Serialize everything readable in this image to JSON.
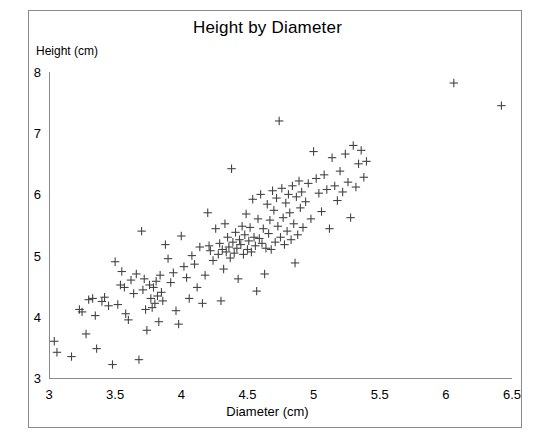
{
  "chart_data": {
    "type": "scatter",
    "title": "Height by Diameter",
    "xlabel": "Diameter (cm)",
    "ylabel": "Height (cm)",
    "xlim": [
      3,
      6.5
    ],
    "ylim": [
      3,
      8
    ],
    "xticks": [
      "3",
      "3.5",
      "4",
      "4.5",
      "5",
      "5.5",
      "6",
      "6.5"
    ],
    "xtick_values": [
      3,
      3.5,
      4,
      4.5,
      5,
      5.5,
      6,
      6.5
    ],
    "yticks": [
      "3",
      "4",
      "5",
      "6",
      "7",
      "8"
    ],
    "ytick_values": [
      3,
      4,
      5,
      6,
      7,
      8
    ],
    "grid": false,
    "legend": false,
    "marker": "plus",
    "marker_color": "#444444",
    "frame_color": "#8a8a8a",
    "background": "#ffffff",
    "series": [
      {
        "name": "observations",
        "x": [
          3.04,
          3.06,
          3.17,
          3.23,
          3.25,
          3.28,
          3.3,
          3.33,
          3.35,
          3.36,
          3.4,
          3.42,
          3.45,
          3.48,
          3.5,
          3.52,
          3.54,
          3.55,
          3.57,
          3.58,
          3.6,
          3.62,
          3.64,
          3.66,
          3.68,
          3.7,
          3.71,
          3.72,
          3.73,
          3.74,
          3.76,
          3.77,
          3.78,
          3.79,
          3.8,
          3.81,
          3.82,
          3.83,
          3.84,
          3.85,
          3.86,
          3.88,
          3.9,
          3.92,
          3.94,
          3.96,
          3.98,
          4.0,
          4.02,
          4.04,
          4.06,
          4.08,
          4.1,
          4.12,
          4.14,
          4.16,
          4.18,
          4.2,
          4.21,
          4.22,
          4.24,
          4.26,
          4.28,
          4.29,
          4.3,
          4.31,
          4.32,
          4.33,
          4.34,
          4.35,
          4.36,
          4.37,
          4.38,
          4.39,
          4.4,
          4.41,
          4.42,
          4.43,
          4.44,
          4.45,
          4.46,
          4.47,
          4.48,
          4.49,
          4.5,
          4.51,
          4.52,
          4.53,
          4.54,
          4.55,
          4.56,
          4.57,
          4.58,
          4.59,
          4.6,
          4.61,
          4.62,
          4.63,
          4.64,
          4.65,
          4.66,
          4.67,
          4.68,
          4.69,
          4.7,
          4.71,
          4.72,
          4.73,
          4.74,
          4.75,
          4.76,
          4.77,
          4.78,
          4.79,
          4.8,
          4.81,
          4.82,
          4.83,
          4.84,
          4.85,
          4.86,
          4.87,
          4.88,
          4.89,
          4.9,
          4.91,
          4.92,
          4.94,
          4.96,
          4.98,
          5.0,
          5.02,
          5.04,
          5.06,
          5.08,
          5.1,
          5.12,
          5.14,
          5.16,
          5.18,
          5.2,
          5.22,
          5.24,
          5.26,
          5.28,
          5.3,
          5.32,
          5.34,
          5.36,
          5.38,
          5.4,
          6.06,
          6.42
        ],
        "y": [
          3.6,
          3.42,
          3.35,
          4.12,
          4.08,
          3.72,
          4.28,
          4.3,
          4.02,
          3.48,
          4.25,
          4.32,
          4.18,
          3.22,
          4.9,
          4.2,
          4.52,
          4.74,
          4.48,
          4.05,
          3.95,
          4.6,
          4.38,
          4.7,
          3.3,
          5.4,
          4.44,
          4.62,
          4.12,
          3.78,
          4.52,
          4.3,
          4.15,
          4.48,
          4.22,
          4.58,
          4.34,
          3.92,
          4.68,
          4.4,
          4.26,
          5.18,
          4.95,
          4.56,
          4.72,
          4.1,
          3.88,
          5.32,
          4.82,
          4.64,
          4.3,
          5.0,
          4.86,
          4.48,
          5.14,
          4.22,
          4.68,
          5.7,
          5.16,
          5.08,
          4.92,
          5.44,
          5.02,
          5.2,
          4.26,
          5.1,
          4.78,
          5.52,
          5.06,
          5.3,
          5.14,
          4.96,
          6.42,
          5.22,
          5.04,
          5.38,
          5.12,
          4.62,
          5.26,
          5.18,
          5.48,
          5.02,
          5.34,
          5.68,
          5.1,
          5.24,
          5.46,
          5.06,
          5.92,
          5.3,
          5.16,
          4.42,
          5.6,
          5.28,
          6.0,
          5.2,
          5.44,
          4.7,
          5.12,
          5.84,
          5.36,
          5.58,
          5.1,
          6.06,
          5.74,
          5.22,
          5.94,
          5.48,
          7.2,
          5.3,
          6.1,
          5.62,
          5.18,
          5.86,
          5.4,
          6.0,
          5.7,
          5.26,
          6.14,
          5.52,
          4.88,
          5.96,
          5.34,
          6.22,
          5.78,
          6.04,
          5.46,
          5.88,
          6.18,
          5.6,
          6.7,
          6.26,
          6.02,
          5.72,
          6.32,
          6.08,
          5.44,
          6.6,
          6.14,
          5.9,
          6.38,
          6.04,
          6.66,
          6.2,
          5.62,
          6.8,
          6.12,
          6.5,
          6.72,
          6.28,
          6.54,
          7.82,
          7.45
        ]
      }
    ]
  }
}
